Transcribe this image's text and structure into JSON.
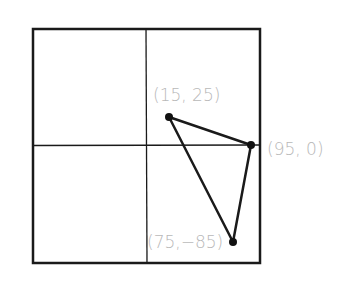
{
  "diagram": {
    "type": "coordinate-plane-triangle",
    "frame_color": "#1a1a1a",
    "label_color": "#b8b8b8",
    "points": [
      {
        "label": "(15, 25)",
        "x": 15,
        "y": 25
      },
      {
        "label": "(95, 0)",
        "x": 95,
        "y": 0
      },
      {
        "label": "(75,−85)",
        "x": 75,
        "y": -85
      }
    ]
  }
}
